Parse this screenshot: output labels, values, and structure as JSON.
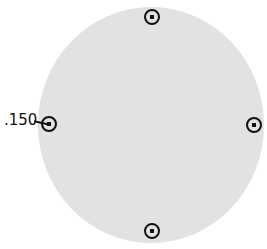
{
  "shape": {
    "type": "circle",
    "fill": "#e2e2e2"
  },
  "handles": [
    {
      "position": "top"
    },
    {
      "position": "right"
    },
    {
      "position": "bottom"
    },
    {
      "position": "left"
    }
  ],
  "dimension_label": ".150"
}
